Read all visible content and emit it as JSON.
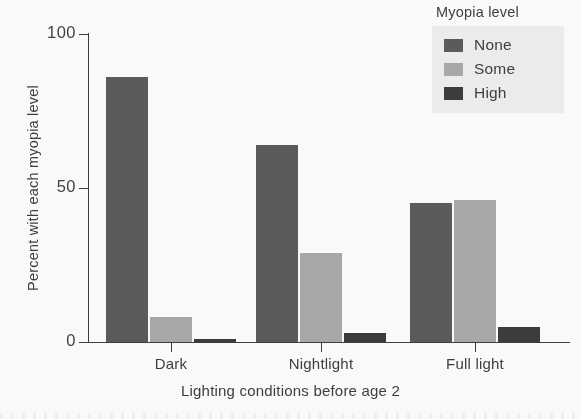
{
  "chart_data": {
    "type": "bar",
    "title": "",
    "subtitle": "",
    "xlabel": "Lighting conditions before age 2",
    "ylabel": "Percent with each myopia level",
    "categories": [
      "Dark",
      "Nightlight",
      "Full light"
    ],
    "series": [
      {
        "name": "None",
        "color": "#5a5a5a",
        "values": [
          86,
          64,
          45
        ]
      },
      {
        "name": "Some",
        "color": "#a8a8a8",
        "values": [
          8,
          29,
          46
        ]
      },
      {
        "name": "High",
        "color": "#3a3a3a",
        "values": [
          1,
          3,
          5
        ]
      }
    ],
    "ylim": [
      0,
      100
    ],
    "yticks": [
      0,
      50,
      100
    ],
    "ytick_labels": [
      "0",
      "50",
      "100"
    ],
    "grid": false,
    "legend": {
      "title": "Myopia level",
      "position": "top-right",
      "entries": [
        "None",
        "Some",
        "High"
      ]
    }
  },
  "axes": {
    "y_tick_0": "0",
    "y_tick_50": "50",
    "y_tick_100": "100",
    "y_title": "Percent with each myopia level",
    "x_title": "Lighting conditions before age 2",
    "x_tick_1": "Dark",
    "x_tick_2": "Nightlight",
    "x_tick_3": "Full light"
  },
  "legend": {
    "title": "Myopia level",
    "items": [
      {
        "label": "None",
        "color": "#5a5a5a"
      },
      {
        "label": "Some",
        "color": "#a8a8a8"
      },
      {
        "label": "High",
        "color": "#3a3a3a"
      }
    ]
  },
  "colors": {
    "none": "#5a5a5a",
    "some": "#a8a8a8",
    "high": "#3a3a3a",
    "axis": "#3b3b3b",
    "background": "#fdfdfb",
    "legend_panel": "#eeeeec"
  }
}
